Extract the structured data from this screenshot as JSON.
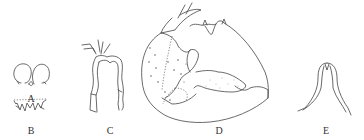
{
  "figure": {
    "type": "morphology illustration plate",
    "panels": [
      {
        "id": "A",
        "label": "A",
        "label_pos": [
          31,
          99
        ]
      },
      {
        "id": "B",
        "label": "B",
        "label_pos": [
          31,
          131
        ]
      },
      {
        "id": "C",
        "label": "C",
        "label_pos": [
          110,
          131
        ]
      },
      {
        "id": "D",
        "label": "D",
        "label_pos": [
          219,
          131
        ]
      },
      {
        "id": "E",
        "label": "E",
        "label_pos": [
          326,
          131
        ]
      }
    ],
    "colors": {
      "background": "#ffffff",
      "line": "#444444",
      "text": "#333333"
    }
  }
}
